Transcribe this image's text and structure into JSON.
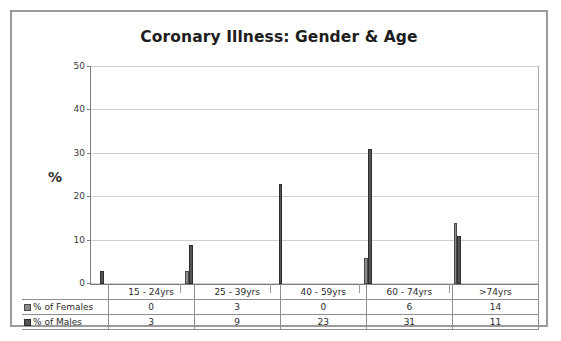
{
  "chart_data": {
    "type": "bar",
    "title": "Coronary Illness: Gender & Age",
    "xlabel": "",
    "ylabel": "%",
    "ylim": [
      0,
      50
    ],
    "yticks": [
      0,
      10,
      20,
      30,
      40,
      50
    ],
    "grid": true,
    "legend_position": "data-table-left",
    "categories": [
      "15 - 24yrs",
      "25 - 39yrs",
      "40 - 59yrs",
      "60 - 74yrs",
      ">74yrs"
    ],
    "series": [
      {
        "name": "% of Females",
        "color": "#8b8b8b",
        "values": [
          0,
          3,
          0,
          6,
          14
        ]
      },
      {
        "name": "% of Males",
        "color": "#555555",
        "values": [
          3,
          9,
          23,
          31,
          11
        ]
      }
    ]
  },
  "table": {
    "row_labels": [
      "% of Females",
      "% of Males"
    ],
    "columns": [
      "15 - 24yrs",
      "25 - 39yrs",
      "40 - 59yrs",
      "60 - 74yrs",
      ">74yrs"
    ],
    "females": [
      "0",
      "3",
      "0",
      "6",
      "14"
    ],
    "males": [
      "3",
      "9",
      "23",
      "31",
      "11"
    ]
  },
  "ticks": {
    "t0": "0",
    "t10": "10",
    "t20": "20",
    "t30": "30",
    "t40": "40",
    "t50": "50"
  }
}
